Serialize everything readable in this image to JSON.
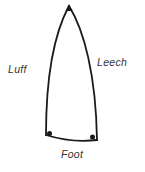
{
  "diagram": {
    "labels": {
      "luff": "Luff",
      "leech": "Leech",
      "foot": "Foot"
    },
    "colors": {
      "stroke": "#1a1a1a",
      "text": "#333333",
      "background": "#ffffff"
    },
    "corners": [
      {
        "name": "head",
        "marker": "triangle"
      },
      {
        "name": "tack",
        "marker": "dot"
      },
      {
        "name": "clew",
        "marker": "dot"
      }
    ]
  }
}
